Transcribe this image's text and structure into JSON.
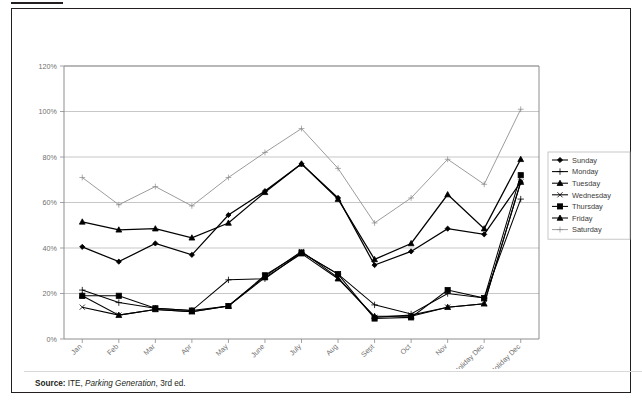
{
  "figure": {
    "source_prefix": "Source:",
    "source_text": "ITE, ",
    "source_italic": "Parking Generation",
    "source_suffix": ", 3rd ed."
  },
  "chart_data": {
    "type": "line",
    "title": "",
    "xlabel": "",
    "ylabel": "",
    "ylim": [
      0,
      120
    ],
    "yticks": [
      0,
      20,
      40,
      60,
      80,
      100,
      120
    ],
    "ytick_labels": [
      "0%",
      "20%",
      "40%",
      "60%",
      "80%",
      "100%",
      "120%"
    ],
    "grid": true,
    "legend_position": "right",
    "categories": [
      "Jan",
      "Feb",
      "Mar",
      "Apr",
      "May",
      "June",
      "July",
      "Aug",
      "Sept",
      "Oct",
      "Nov",
      "Pre-Holiday Dec",
      "Holiday Dec"
    ],
    "series": [
      {
        "name": "Sunday",
        "marker": "diamond",
        "color": "#000000",
        "values": [
          40.5,
          34,
          42,
          37,
          54.5,
          65,
          77,
          62,
          32.5,
          38.5,
          48.5,
          46,
          69
        ]
      },
      {
        "name": "Monday",
        "marker": "plus",
        "color": "#000000",
        "values": [
          21.5,
          16,
          13.5,
          12.5,
          26,
          26.5,
          38,
          28.5,
          15,
          11,
          20,
          18,
          61.5
        ]
      },
      {
        "name": "Tuesday",
        "marker": "triangle",
        "color": "#000000",
        "values": [
          19,
          10.5,
          13,
          12,
          14.5,
          27,
          37.5,
          26.5,
          10,
          10,
          14,
          15.5,
          69
        ]
      },
      {
        "name": "Wednesday",
        "marker": "cross",
        "color": "#000000",
        "values": [
          14,
          10.5,
          13,
          12,
          14.5,
          27.5,
          38.5,
          27,
          9.5,
          10.5,
          14,
          15.5,
          69
        ]
      },
      {
        "name": "Thursday",
        "marker": "square",
        "color": "#000000",
        "values": [
          19,
          19,
          13.5,
          12.5,
          14.5,
          28,
          38,
          28.5,
          9,
          9.5,
          21.5,
          18,
          72
        ]
      },
      {
        "name": "Friday",
        "marker": "triangle",
        "color": "#000000",
        "values": [
          51.5,
          48,
          48.5,
          44.5,
          51,
          64.5,
          77,
          61.5,
          35,
          42,
          63.5,
          48.5,
          79
        ]
      },
      {
        "name": "Saturday",
        "marker": "plus",
        "color": "#8a8a8a",
        "values": [
          71,
          59,
          67,
          58.5,
          71,
          82,
          92.5,
          75,
          51,
          62,
          79,
          68,
          101
        ]
      }
    ]
  }
}
